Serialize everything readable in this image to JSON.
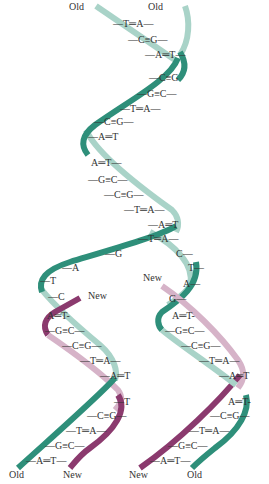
{
  "colors": {
    "old_strand_front": "#2e8f7a",
    "old_strand_back": "#a9d3c8",
    "new_strand_front": "#8b3a6e",
    "new_strand_back": "#d6b3c8",
    "text": "#333333"
  },
  "labels": {
    "top_left": "Old",
    "top_right": "Old",
    "fork_left_new": "New",
    "fork_right_new": "New",
    "bottom_left_1": "Old",
    "bottom_left_2": "New",
    "bottom_right_1": "New",
    "bottom_right_2": "Old"
  },
  "parent_pairs": [
    {
      "text": "—T═A—",
      "x": 113,
      "y": 19
    },
    {
      "text": "—C≡G—",
      "x": 128,
      "y": 35
    },
    {
      "text": "—A═T—",
      "x": 145,
      "y": 50
    },
    {
      "text": "—C≡G",
      "x": 149,
      "y": 73
    },
    {
      "text": "—G≡C—",
      "x": 137,
      "y": 89
    },
    {
      "text": "—T═A—",
      "x": 120,
      "y": 104
    },
    {
      "text": "—C≡G—",
      "x": 94,
      "y": 117
    },
    {
      "text": "—A═T",
      "x": 88,
      "y": 132
    },
    {
      "text": "A═T—",
      "x": 91,
      "y": 158
    },
    {
      "text": "—G≡C—",
      "x": 88,
      "y": 175
    },
    {
      "text": "—C≡G—",
      "x": 104,
      "y": 190
    },
    {
      "text": "—T═A—",
      "x": 124,
      "y": 205
    },
    {
      "text": "—A═T",
      "x": 148,
      "y": 220
    },
    {
      "text": "—T═A—",
      "x": 138,
      "y": 234
    }
  ],
  "unpaired_left": [
    {
      "text": "—G",
      "x": 105,
      "y": 249
    },
    {
      "text": "—A",
      "x": 62,
      "y": 263
    },
    {
      "text": "—T",
      "x": 40,
      "y": 276
    },
    {
      "text": "—C",
      "x": 48,
      "y": 292
    }
  ],
  "unpaired_right": [
    {
      "text": "C—",
      "x": 176,
      "y": 249
    },
    {
      "text": "T—",
      "x": 188,
      "y": 263
    },
    {
      "text": "A—",
      "x": 183,
      "y": 279
    },
    {
      "text": "G—",
      "x": 169,
      "y": 294
    }
  ],
  "left_daughter_pairs": [
    {
      "text": "A═T-",
      "x": 47,
      "y": 311
    },
    {
      "text": "—G≡C—",
      "x": 45,
      "y": 326
    },
    {
      "text": "—C≡G—",
      "x": 62,
      "y": 341
    },
    {
      "text": "—T═A—",
      "x": 80,
      "y": 356
    },
    {
      "text": "—A═T",
      "x": 100,
      "y": 371
    },
    {
      "text": "—T",
      "x": 114,
      "y": 397
    },
    {
      "text": "—C≡G—",
      "x": 87,
      "y": 411
    },
    {
      "text": "—T═A—",
      "x": 66,
      "y": 426
    },
    {
      "text": "—G≡C—",
      "x": 45,
      "y": 441
    },
    {
      "text": "—A═T—",
      "x": 26,
      "y": 456
    }
  ],
  "right_daughter_pairs": [
    {
      "text": "A═T-",
      "x": 172,
      "y": 311
    },
    {
      "text": "—G≡C—",
      "x": 165,
      "y": 326
    },
    {
      "text": "—C≡G—",
      "x": 181,
      "y": 341
    },
    {
      "text": "—T═A—",
      "x": 199,
      "y": 356
    },
    {
      "text": "—A═T",
      "x": 219,
      "y": 371
    },
    {
      "text": "A═T-",
      "x": 228,
      "y": 397
    },
    {
      "text": "—C≡G—",
      "x": 210,
      "y": 411
    },
    {
      "text": "—T═A—",
      "x": 189,
      "y": 426
    },
    {
      "text": "—G≡C—",
      "x": 168,
      "y": 441
    },
    {
      "text": "—A═T—",
      "x": 150,
      "y": 456
    }
  ]
}
